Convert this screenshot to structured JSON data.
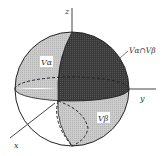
{
  "diagram": {
    "type": "3d-sphere-regions",
    "axes": {
      "x_label": "x",
      "y_label": "y",
      "z_label": "z"
    },
    "regions": [
      {
        "name": "V_alpha",
        "label": "Vα",
        "shade": "#c8c8c8",
        "position": "upper-left octant"
      },
      {
        "name": "V_beta",
        "label": "Vβ",
        "shade": "#c8c8c8",
        "position": "lower-right octant"
      },
      {
        "name": "intersection",
        "label": "Vα∩Vβ",
        "shade": "#3a3a3a",
        "position": "upper-right"
      }
    ],
    "labels": {
      "va": "Vα",
      "vb": "Vβ",
      "intersection": "Vα∩Vβ"
    },
    "colors": {
      "dark_region": "#3a3a3a",
      "light_region": "#c9c9c9",
      "outline": "#222222",
      "background": "#ffffff"
    }
  }
}
